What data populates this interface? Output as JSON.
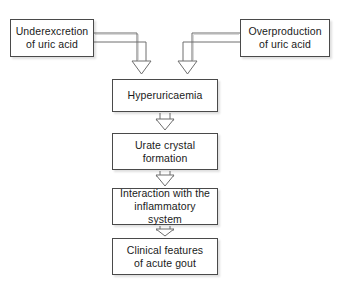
{
  "diagram": {
    "background_color": "#ffffff",
    "border_color": "#4a4a4a",
    "connector_color": "#6e6e6e",
    "text_color": "#1a1a1a",
    "nodes": [
      {
        "id": "underexcretion",
        "label": "Underexcretion\nof uric acid"
      },
      {
        "id": "overproduction",
        "label": "Overproduction\nof uric acid"
      },
      {
        "id": "hyperuricaemia",
        "label": "Hyperuricaemia"
      },
      {
        "id": "urate_crystal",
        "label": "Urate crystal\nformation"
      },
      {
        "id": "inflammatory",
        "label": "Interaction with the\ninflammatory system"
      },
      {
        "id": "clinical_features",
        "label": "Clinical features\nof acute gout"
      }
    ],
    "edges": [
      {
        "id": "edge-underexcretion-hyperuricaemia",
        "from": "underexcretion",
        "to": "hyperuricaemia",
        "style": "elbow-arrow"
      },
      {
        "id": "edge-overproduction-hyperuricaemia",
        "from": "overproduction",
        "to": "hyperuricaemia",
        "style": "elbow-arrow"
      },
      {
        "id": "edge-hyperuricaemia-urate",
        "from": "hyperuricaemia",
        "to": "urate_crystal",
        "style": "straight-arrow"
      },
      {
        "id": "edge-urate-inflammatory",
        "from": "urate_crystal",
        "to": "inflammatory",
        "style": "straight-arrow"
      },
      {
        "id": "edge-inflammatory-clinical",
        "from": "inflammatory",
        "to": "clinical_features",
        "style": "straight-arrow"
      }
    ]
  }
}
